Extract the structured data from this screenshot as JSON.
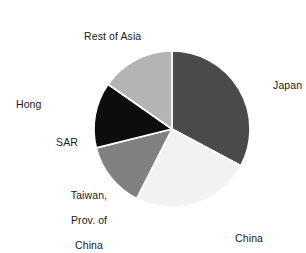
{
  "chart_data": {
    "type": "pie",
    "title": "",
    "subtitle": "",
    "xlabel": "",
    "ylabel": "",
    "legend_position": "none",
    "grid": false,
    "units": "percent of total",
    "categories": [
      "Japan",
      "China",
      "Taiwan, Prov. of China",
      "Hong Kong SAR",
      "Rest of Asia"
    ],
    "values": [
      32.8,
      24.7,
      13.6,
      13.6,
      15.3
    ],
    "start_angle_deg": 0,
    "direction": "clockwise",
    "slices": [
      {
        "label": "Japan",
        "value": 32.8,
        "start_angle_deg": 0,
        "end_angle_deg": 118,
        "color": "#4a4a4a",
        "label_lines": [
          "Japan"
        ]
      },
      {
        "label": "China",
        "value": 24.7,
        "start_angle_deg": 118,
        "end_angle_deg": 207,
        "color": "#f2f2f2",
        "label_lines": [
          "China"
        ]
      },
      {
        "label": "Taiwan, Prov. of China",
        "value": 13.6,
        "start_angle_deg": 207,
        "end_angle_deg": 256,
        "color": "#808080",
        "label_lines": [
          "Taiwan,",
          "Prov. of",
          "China"
        ]
      },
      {
        "label": "Hong Kong SAR",
        "value": 13.6,
        "start_angle_deg": 256,
        "end_angle_deg": 305,
        "color": "#0d0d0d",
        "label_lines": [
          "Hong",
          "SAR"
        ]
      },
      {
        "label": "Rest of Asia",
        "value": 15.3,
        "start_angle_deg": 305,
        "end_angle_deg": 360,
        "color": "#b4b4b4",
        "label_lines": [
          "Rest of Asia"
        ]
      }
    ]
  },
  "labels": {
    "japan": "Japan",
    "china": "China",
    "taiwan_line1": "Taiwan,",
    "taiwan_line2": "Prov. of",
    "taiwan_line3": "China",
    "hongkong_line1": "Hong",
    "hongkong_line2": "SAR",
    "rest_of_asia": "Rest of Asia"
  },
  "colors": {
    "background": "#ffffff",
    "text": "#1a1a1a",
    "slice_separator": "#ffffff",
    "japan": "#4a4a4a",
    "china": "#f2f2f2",
    "taiwan": "#808080",
    "hongkong": "#0d0d0d",
    "rest_of_asia": "#b4b4b4"
  },
  "geometry": {
    "center_x": 172,
    "center_y": 129,
    "radius": 78
  }
}
